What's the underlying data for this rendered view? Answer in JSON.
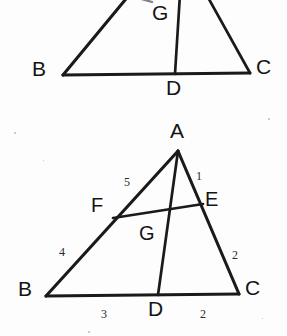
{
  "document": {
    "kind": "scanned-geometry-diagram",
    "background_color": "#fdfdfd",
    "ink_color": "#1a1a1a",
    "width": 287,
    "height": 336
  },
  "figures": [
    {
      "id": "figure-top",
      "caption": "",
      "cropped": true,
      "note": "Upper triangle partially cut off at the top edge of the page",
      "vertices": [
        {
          "name": "B",
          "label": "B",
          "x": 63,
          "y": 75,
          "label_x": 32,
          "label_y": 58
        },
        {
          "name": "C",
          "label": "C",
          "x": 250,
          "y": 73,
          "label_x": 256,
          "label_y": 56
        },
        {
          "name": "D",
          "label": "D",
          "x": 175,
          "y": 74,
          "label_x": 166,
          "label_y": 77
        },
        {
          "name": "G",
          "label": "G",
          "x": 176,
          "y": 18,
          "label_x": 152,
          "label_y": 2
        }
      ],
      "segments": [
        {
          "from": "B",
          "to": "C"
        },
        {
          "from": "B",
          "to": "A-top"
        },
        {
          "from": "C",
          "to": "A-top"
        },
        {
          "from": "D",
          "to": "A-top"
        }
      ],
      "numbers": []
    },
    {
      "id": "figure-bottom",
      "caption": "",
      "cropped": false,
      "note": "Triangle ABC with cevians AD and BE meeting at G, and point F on AB",
      "vertices": [
        {
          "name": "A",
          "label": "A",
          "x": 178,
          "y": 151,
          "label_x": 170,
          "label_y": 120
        },
        {
          "name": "B",
          "label": "B",
          "x": 46,
          "y": 296,
          "label_x": 18,
          "label_y": 278
        },
        {
          "name": "C",
          "label": "C",
          "x": 239,
          "y": 294,
          "label_x": 245,
          "label_y": 277
        },
        {
          "name": "D",
          "label": "D",
          "x": 158,
          "y": 295,
          "label_x": 148,
          "label_y": 298
        },
        {
          "name": "E",
          "label": "E",
          "x": 198,
          "y": 206,
          "label_x": 205,
          "label_y": 189
        },
        {
          "name": "F",
          "label": "F",
          "x": 117,
          "y": 215,
          "label_x": 91,
          "label_y": 195
        },
        {
          "name": "G",
          "label": "G",
          "x": 158,
          "y": 211,
          "label_x": 139,
          "label_y": 223
        }
      ],
      "segments": [
        {
          "from": "A",
          "to": "B"
        },
        {
          "from": "A",
          "to": "C"
        },
        {
          "from": "B",
          "to": "C"
        },
        {
          "from": "A",
          "to": "D"
        },
        {
          "from": "F",
          "to": "E"
        }
      ],
      "numbers": [
        {
          "value": "5",
          "for_segment": "A-F",
          "x": 124,
          "y": 176
        },
        {
          "value": "1",
          "for_segment": "A-E",
          "x": 196,
          "y": 170
        },
        {
          "value": "4",
          "for_segment": "F-B",
          "x": 59,
          "y": 246
        },
        {
          "value": "2",
          "for_segment": "E-C",
          "x": 232,
          "y": 249
        },
        {
          "value": "3",
          "for_segment": "B-D",
          "x": 101,
          "y": 308
        },
        {
          "value": "2",
          "for_segment": "D-C",
          "x": 200,
          "y": 308
        }
      ]
    }
  ],
  "specks": [
    {
      "x": 14,
      "y": 132,
      "size": 2
    },
    {
      "x": 268,
      "y": 118,
      "size": 2
    },
    {
      "x": 88,
      "y": 331,
      "size": 2
    },
    {
      "x": 43,
      "y": 160,
      "size": 1
    },
    {
      "x": 262,
      "y": 318,
      "size": 1
    }
  ]
}
